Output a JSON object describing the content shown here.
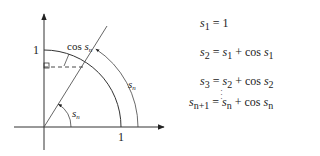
{
  "diagram": {
    "labels": {
      "y_axis_one": "1",
      "x_axis_one": "1",
      "cos_label_prefix": "cos ",
      "cos_label_var": "s",
      "cos_label_sub": "n",
      "angle_label_var": "s",
      "angle_label_sub": "n",
      "arc_label_var": "s",
      "arc_label_sub": "n"
    },
    "geometry": {
      "origin": [
        44,
        127
      ],
      "unit_radius_px": 77,
      "outer_arc_radius_px": 94,
      "angle_deg": 58,
      "stroke_color": "#333333"
    }
  },
  "equations": [
    {
      "lhs": "s",
      "lhs_sub": "1",
      "rhs": "= 1"
    },
    {
      "lhs": "s",
      "lhs_sub": "2",
      "rhs_a": "s",
      "rhs_a_sub": "1",
      "rhs_b": "s",
      "rhs_b_sub": "1"
    },
    {
      "lhs": "s",
      "lhs_sub": "3",
      "rhs_a": "s",
      "rhs_a_sub": "2",
      "rhs_b": "s",
      "rhs_b_sub": "2"
    },
    {
      "lhs": "s",
      "lhs_sub": "n+1",
      "rhs_a": "s",
      "rhs_a_sub": "n",
      "rhs_b": "s",
      "rhs_b_sub": "n"
    }
  ],
  "symbols": {
    "equals": "=",
    "plus": "+",
    "cos": "cos",
    "vdots": "⋮"
  }
}
